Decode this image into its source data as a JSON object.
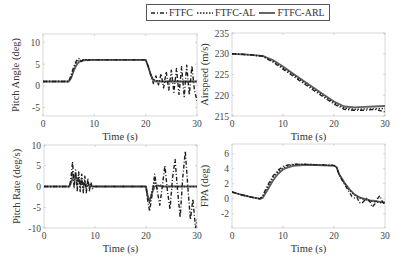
{
  "legend": {
    "items": [
      {
        "label": "FTFC",
        "style": "dashdot",
        "color": "#222222"
      },
      {
        "label": "FTFC-AL",
        "style": "dotted",
        "color": "#222222"
      },
      {
        "label": "FTFC-ARL",
        "style": "solid",
        "color": "#555555"
      }
    ]
  },
  "chart_data": [
    {
      "type": "line",
      "title": "",
      "xlabel": "Time (s)",
      "ylabel": "Pitch Angle (deg)",
      "xlim": [
        0,
        30
      ],
      "ylim": [
        -7,
        12
      ],
      "xticks": [
        0,
        10,
        20,
        30
      ],
      "yticks": [
        -5,
        0,
        5,
        10
      ],
      "box": {
        "x0": 43,
        "x1": 197,
        "y0": 34,
        "y1": 116
      },
      "grid": false,
      "series": [
        {
          "name": "FTFC",
          "x": [
            0,
            5,
            5.5,
            6,
            6.5,
            7,
            7.5,
            8,
            8.5,
            9,
            10,
            15,
            20,
            20.5,
            21,
            21.5,
            22,
            22.5,
            23,
            23.5,
            24,
            24.5,
            25,
            25.5,
            26,
            26.5,
            27,
            27.5,
            28,
            28.5,
            29,
            29.5,
            30
          ],
          "values": [
            1,
            1,
            2.5,
            4.5,
            5.8,
            6.3,
            5.6,
            6.3,
            5.8,
            6,
            6,
            6,
            6,
            4.5,
            2.5,
            0.5,
            2.3,
            0.2,
            2.8,
            -0.5,
            3.3,
            -1,
            3.6,
            -1.5,
            4,
            -2,
            4.4,
            -2.5,
            4.8,
            -2.2,
            4.6,
            -1,
            -3.5
          ]
        },
        {
          "name": "FTFC-AL",
          "x": [
            0,
            5,
            5.5,
            6,
            6.5,
            7,
            7.5,
            8,
            9,
            10,
            15,
            20,
            20.5,
            21,
            21.5,
            22,
            23,
            24,
            25,
            26,
            27,
            28,
            29,
            30
          ],
          "values": [
            1,
            1,
            2,
            4,
            5.5,
            6,
            5.8,
            6.1,
            6,
            6,
            6,
            6,
            4.5,
            2.5,
            1.5,
            1.2,
            1,
            1,
            1,
            1,
            1,
            1,
            1,
            1
          ]
        },
        {
          "name": "FTFC-ARL",
          "x": [
            0,
            5,
            5.5,
            6,
            6.5,
            7,
            7.5,
            8,
            9,
            10,
            15,
            20,
            20.5,
            21,
            21.5,
            22,
            23,
            24,
            25,
            26,
            27,
            28,
            29,
            30
          ],
          "values": [
            1,
            1,
            1.8,
            3.5,
            4.8,
            5.5,
            5.8,
            5.9,
            6,
            6,
            6,
            6,
            4.5,
            2.5,
            1.2,
            1,
            1,
            1,
            1,
            1,
            1,
            1,
            1,
            1
          ]
        }
      ]
    },
    {
      "type": "line",
      "title": "",
      "xlabel": "Time (s)",
      "ylabel": "Airspeed (m/s)",
      "xlim": [
        0,
        30
      ],
      "ylim": [
        215,
        235
      ],
      "xticks": [
        0,
        10,
        20,
        30
      ],
      "yticks": [
        215,
        220,
        225,
        230,
        235
      ],
      "box": {
        "x0": 232,
        "x1": 385,
        "y0": 33,
        "y1": 116
      },
      "grid": false,
      "series": [
        {
          "name": "FTFC",
          "x": [
            0,
            3,
            6,
            8,
            10,
            12,
            14,
            16,
            18,
            20,
            22,
            24,
            26,
            28,
            29,
            30
          ],
          "values": [
            230,
            229.8,
            229.4,
            228.0,
            226.3,
            224.6,
            222.9,
            221.2,
            219.5,
            217.9,
            216.6,
            216.4,
            216.4,
            216.6,
            216.3,
            216.0
          ]
        },
        {
          "name": "FTFC-AL",
          "x": [
            0,
            3,
            6,
            8,
            10,
            12,
            14,
            16,
            18,
            20,
            22,
            24,
            26,
            28,
            30
          ],
          "values": [
            230,
            229.8,
            229.4,
            228.2,
            226.6,
            224.9,
            223.2,
            221.5,
            219.8,
            218.2,
            216.9,
            216.6,
            216.7,
            216.7,
            216.8
          ]
        },
        {
          "name": "FTFC-ARL",
          "x": [
            0,
            3,
            6,
            8,
            10,
            12,
            14,
            16,
            18,
            20,
            22,
            24,
            26,
            28,
            30
          ],
          "values": [
            230,
            229.8,
            229.5,
            228.5,
            226.9,
            225.2,
            223.5,
            221.8,
            220.1,
            218.5,
            217.3,
            217.1,
            217.2,
            217.3,
            217.4
          ]
        }
      ]
    },
    {
      "type": "line",
      "title": "",
      "xlabel": "Time (s)",
      "ylabel": "Pitch Rate (deg/s)",
      "xlim": [
        0,
        30
      ],
      "ylim": [
        -10,
        10
      ],
      "xticks": [
        0,
        10,
        20,
        30
      ],
      "yticks": [
        -10,
        -5,
        0,
        5,
        10
      ],
      "box": {
        "x0": 44,
        "x1": 197,
        "y0": 145,
        "y1": 228
      },
      "grid": false,
      "series": [
        {
          "name": "FTFC",
          "x": [
            0,
            5,
            5.3,
            5.6,
            5.9,
            6.2,
            6.5,
            6.8,
            7.1,
            7.4,
            7.7,
            8.0,
            8.3,
            8.6,
            8.9,
            9.2,
            9.5,
            10,
            20,
            20.3,
            20.7,
            21.2,
            21.7,
            22.2,
            22.7,
            23.2,
            23.7,
            24.2,
            24.7,
            25.2,
            25.7,
            26.2,
            26.7,
            27.2,
            27.7,
            28.2,
            28.7,
            29.2,
            29.7,
            30
          ],
          "values": [
            0,
            0,
            2,
            6,
            -0.5,
            4,
            -1,
            3.5,
            -1.2,
            3,
            -1.5,
            2.5,
            -1.5,
            2,
            -1,
            1,
            -0.5,
            0,
            0,
            -3,
            -6,
            -2,
            3,
            -1,
            -4.5,
            0,
            5,
            -1,
            -5.5,
            2,
            6.5,
            -1,
            -7.5,
            2,
            8.5,
            0,
            -8,
            -3,
            -10,
            -8
          ]
        },
        {
          "name": "FTFC-AL",
          "x": [
            0,
            5,
            5.3,
            5.6,
            5.9,
            6.2,
            6.5,
            6.8,
            7.1,
            7.4,
            7.7,
            8.0,
            8.3,
            8.6,
            9,
            10,
            20,
            20.3,
            20.7,
            21.2,
            21.7,
            22.2,
            22.7,
            23.2,
            24,
            30
          ],
          "values": [
            0,
            0,
            1.5,
            3.5,
            0.5,
            3,
            0,
            2.5,
            -0.5,
            2,
            -0.8,
            1.5,
            -0.5,
            1,
            0,
            0,
            0,
            -2.5,
            -4,
            -1,
            1.5,
            -0.5,
            0.5,
            0,
            0,
            0
          ]
        },
        {
          "name": "FTFC-ARL",
          "x": [
            0,
            5,
            5.5,
            6,
            6.5,
            7,
            7.5,
            8,
            8.5,
            9,
            10,
            20,
            20.3,
            20.7,
            21.2,
            21.7,
            22.2,
            23,
            30
          ],
          "values": [
            0,
            0,
            1.5,
            2.5,
            2,
            1.5,
            1,
            0.6,
            0.3,
            0.1,
            0,
            0,
            -2,
            -3.5,
            -1.5,
            0,
            0.3,
            0,
            0
          ]
        }
      ]
    },
    {
      "type": "line",
      "title": "",
      "xlabel": "Time (s)",
      "ylabel": "FPA (deg)",
      "xlim": [
        0,
        30
      ],
      "ylim": [
        -3.9,
        7.3
      ],
      "xticks": [
        0,
        10,
        20,
        30
      ],
      "yticks": [
        -2,
        0,
        2,
        4,
        6
      ],
      "box": {
        "x0": 232,
        "x1": 385,
        "y0": 144,
        "y1": 228
      },
      "grid": false,
      "series": [
        {
          "name": "FTFC",
          "x": [
            0,
            2,
            4,
            5.5,
            6,
            7,
            8,
            9,
            10,
            11,
            12,
            14,
            16,
            18,
            20,
            20.5,
            21,
            22,
            23,
            23.5,
            24,
            24.5,
            25,
            25.5,
            26,
            26.5,
            27,
            27.5,
            28,
            28.5,
            29,
            29.5,
            30
          ],
          "values": [
            0.9,
            0.5,
            0.2,
            0,
            0.4,
            1.8,
            3,
            3.8,
            4.3,
            4.5,
            4.6,
            4.6,
            4.55,
            4.5,
            4.45,
            4.2,
            3.2,
            2,
            0.9,
            0.3,
            0.1,
            0.2,
            -0.5,
            -0.6,
            -0.2,
            0.1,
            -0.3,
            -1.1,
            -0.7,
            0,
            0.4,
            -0.4,
            -0.7
          ]
        },
        {
          "name": "FTFC-AL",
          "x": [
            0,
            2,
            4,
            5.5,
            6,
            7,
            8,
            9,
            10,
            11,
            12,
            14,
            16,
            18,
            20,
            20.5,
            21,
            22,
            23,
            24,
            25,
            26,
            27,
            28,
            29,
            30
          ],
          "values": [
            0.9,
            0.5,
            0.2,
            0,
            0.3,
            1.6,
            2.8,
            3.6,
            4.1,
            4.4,
            4.55,
            4.6,
            4.55,
            4.5,
            4.45,
            4.2,
            3.2,
            2.1,
            1.2,
            0.5,
            0.1,
            -0.1,
            -0.3,
            -0.4,
            -0.5,
            -0.6
          ]
        },
        {
          "name": "FTFC-ARL",
          "x": [
            0,
            2,
            4,
            5.5,
            6,
            7,
            8,
            9,
            10,
            11,
            12,
            14,
            16,
            18,
            20,
            20.5,
            21,
            22,
            23,
            24,
            25,
            26,
            27,
            28,
            29,
            30
          ],
          "values": [
            0.9,
            0.5,
            0.2,
            0,
            0.1,
            1.2,
            2.4,
            3.3,
            3.9,
            4.2,
            4.4,
            4.5,
            4.5,
            4.45,
            4.4,
            4.2,
            3.3,
            2.2,
            1.3,
            0.6,
            0.2,
            0,
            -0.2,
            -0.3,
            -0.4,
            -0.5
          ]
        }
      ]
    }
  ]
}
